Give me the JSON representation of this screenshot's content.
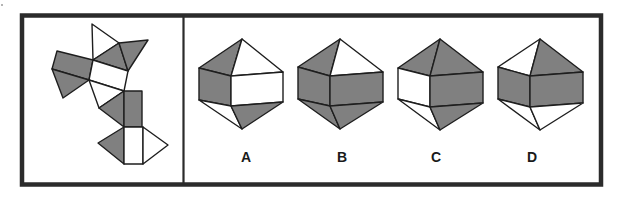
{
  "colors": {
    "shaded": "#808080",
    "unshaded": "#ffffff",
    "line": "#1e1e1e",
    "frame": "#2b2b2b"
  },
  "puzzle": {
    "type": "net-folding",
    "net": {
      "faces": [
        {
          "points": "92,24 119,43 93,60",
          "fill": "unshaded"
        },
        {
          "points": "119,43 93,60 128,71",
          "fill": "shaded"
        },
        {
          "points": "119,43 148,40 128,71",
          "fill": "shaded"
        },
        {
          "points": "57,51 93,60 89,80 52,69",
          "fill": "shaded"
        },
        {
          "points": "93,60 128,71 124,91 89,80",
          "fill": "unshaded"
        },
        {
          "points": "52,69 89,80 63,98",
          "fill": "shaded"
        },
        {
          "points": "89,80 124,91 99,108",
          "fill": "unshaded"
        },
        {
          "points": "124,91 99,108 124,127",
          "fill": "shaded"
        },
        {
          "points": "124,91 142,91 142,127 124,127",
          "fill": "shaded"
        },
        {
          "points": "124,127 98,143 124,164",
          "fill": "shaded"
        },
        {
          "points": "124,127 143,127 143,164 124,164",
          "fill": "unshaded"
        },
        {
          "points": "143,127 168,145 143,164",
          "fill": "unshaded"
        }
      ]
    },
    "options": [
      {
        "label": "A",
        "label_x": 246,
        "faces": [
          {
            "name": "top-left",
            "points": "242,39 199,68 231,76",
            "fill": "shaded"
          },
          {
            "name": "top-right",
            "points": "242,39 231,76 283,72",
            "fill": "unshaded"
          },
          {
            "name": "left",
            "points": "199,68 231,76 231,106 199,100",
            "fill": "shaded"
          },
          {
            "name": "front",
            "points": "231,76 283,72 283,102 231,106",
            "fill": "unshaded"
          },
          {
            "name": "bottom-left",
            "points": "199,100 231,106 242,129",
            "fill": "unshaded"
          },
          {
            "name": "bottom-right",
            "points": "231,106 283,102 242,129",
            "fill": "shaded"
          }
        ]
      },
      {
        "label": "B",
        "label_x": 342,
        "faces": [
          {
            "name": "top-left",
            "points": "340,39 298,67 330,76",
            "fill": "shaded"
          },
          {
            "name": "top-right",
            "points": "340,39 330,76 383,72",
            "fill": "unshaded"
          },
          {
            "name": "left",
            "points": "298,67 330,76 330,106 298,99",
            "fill": "shaded"
          },
          {
            "name": "front",
            "points": "330,76 383,72 383,102 330,106",
            "fill": "shaded"
          },
          {
            "name": "bottom-left",
            "points": "298,99 330,106 340,129",
            "fill": "shaded"
          },
          {
            "name": "bottom-right",
            "points": "330,106 383,102 340,129",
            "fill": "shaded"
          }
        ]
      },
      {
        "label": "C",
        "label_x": 436,
        "faces": [
          {
            "name": "top-left",
            "points": "440,39 398,68 430,76",
            "fill": "shaded"
          },
          {
            "name": "top-right",
            "points": "440,39 430,76 483,72",
            "fill": "shaded"
          },
          {
            "name": "left",
            "points": "398,68 430,76 430,107 398,99",
            "fill": "unshaded"
          },
          {
            "name": "front",
            "points": "430,76 483,72 483,103 430,107",
            "fill": "shaded"
          },
          {
            "name": "bottom-left",
            "points": "398,99 430,107 440,130",
            "fill": "unshaded"
          },
          {
            "name": "bottom-right",
            "points": "430,107 483,103 440,130",
            "fill": "shaded"
          }
        ]
      },
      {
        "label": "D",
        "label_x": 532,
        "faces": [
          {
            "name": "top-left",
            "points": "540,39 498,67 530,76",
            "fill": "unshaded"
          },
          {
            "name": "top-right",
            "points": "540,39 530,76 583,72",
            "fill": "shaded"
          },
          {
            "name": "left",
            "points": "498,67 530,76 530,107 498,99",
            "fill": "shaded"
          },
          {
            "name": "front",
            "points": "530,76 583,72 583,103 530,107",
            "fill": "shaded"
          },
          {
            "name": "bottom-left",
            "points": "498,99 530,107 540,130",
            "fill": "unshaded"
          },
          {
            "name": "bottom-right",
            "points": "530,107 583,103 540,130",
            "fill": "unshaded"
          }
        ]
      }
    ]
  }
}
